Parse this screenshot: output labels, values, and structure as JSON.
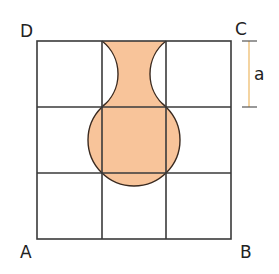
{
  "figure": {
    "type": "geometry-grid",
    "grid": {
      "rows": 3,
      "cols": 3,
      "line_color": "#3a3a3a"
    },
    "shape": {
      "description": "Vase-shaped shaded region: top-middle cell minus two circular arcs, plus circle circumscribing center cell",
      "fill_color": "#f8c49a",
      "stroke_color": "#3a2a20"
    },
    "labels": {
      "top_left": "D",
      "top_right": "C",
      "bottom_left": "A",
      "bottom_right": "B",
      "dimension": "a"
    },
    "dimension_marker": {
      "color": "#f0c27a",
      "spans": "one cell side"
    }
  }
}
